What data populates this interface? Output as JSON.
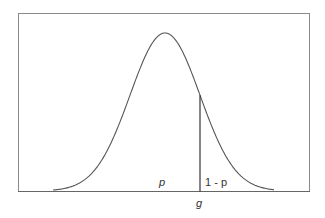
{
  "chart_data": {
    "type": "line",
    "title": "",
    "xlabel": "",
    "ylabel": "",
    "distribution": {
      "shape": "normal",
      "mean_px": 165,
      "sigma_px": 35,
      "peak_y_px": 33,
      "baseline_y_px": 191,
      "x_start_px": 53,
      "x_end_px": 274
    },
    "threshold": {
      "label": "g",
      "x_px": 200
    },
    "annotations": [
      {
        "text": "p",
        "region": "left of threshold"
      },
      {
        "text": "1 - p",
        "region": "right of threshold"
      }
    ],
    "grid": false,
    "legend": null
  },
  "labels": {
    "left_area": "p",
    "right_area": "1 - p",
    "threshold": "g"
  },
  "colors": {
    "curve": "#555555",
    "frame": "#777777",
    "threshold_line": "#222222",
    "text": "#333333"
  }
}
